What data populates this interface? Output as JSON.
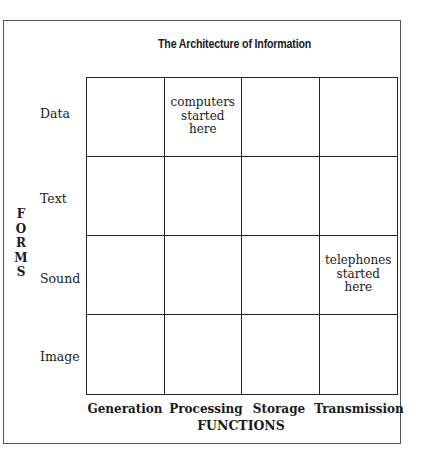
{
  "title": "The Architecture of Information",
  "rows_axis_label": [
    "F",
    "O",
    "R",
    "M",
    "S"
  ],
  "columns_axis_label": "FUNCTIONS",
  "rows": [
    "Data",
    "Text",
    "Sound",
    "Image"
  ],
  "columns": [
    "Generation",
    "Processing",
    "Storage",
    "Transmission"
  ],
  "cells": [
    [
      "",
      "computers\nstarted\nhere",
      "",
      ""
    ],
    [
      "",
      "",
      "",
      ""
    ],
    [
      "",
      "",
      "",
      "telephones\nstarted\nhere"
    ],
    [
      "",
      "",
      "",
      ""
    ]
  ],
  "annotations": [
    {
      "row": "Data",
      "column": "Processing",
      "text": "computers started here"
    },
    {
      "row": "Sound",
      "column": "Transmission",
      "text": "telephones started here"
    }
  ]
}
